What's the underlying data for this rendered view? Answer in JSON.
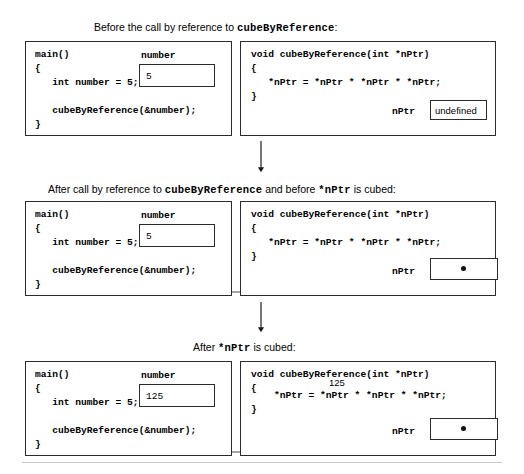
{
  "figure": {
    "title_text_hidden": "",
    "panels": [
      {
        "id": "panel-before",
        "caption_prefix": "Before the call by reference to ",
        "caption_code": "cubeByReference",
        "caption_middle": "",
        "caption_code2": "",
        "caption_suffix": ":",
        "left_box": {
          "name": "main-function-box",
          "code": "main()\n{\n   int number = 5;\n\n   cubeByReference(&number);\n}",
          "variable_label": "number",
          "variable_value": "5"
        },
        "right_box": {
          "name": "cubebyreference-function-box",
          "code": "void cubeByReference(int *nPtr)\n{\n   *nPtr = *nPtr * *nPtr * *nPtr;\n}",
          "variable_label": "nPtr",
          "variable_value": "undefined",
          "annotation": ""
        }
      },
      {
        "id": "panel-after-call",
        "caption_prefix": "After call by reference to ",
        "caption_code": "cubeByReference",
        "caption_middle": " and before ",
        "caption_code2": "*nPtr",
        "caption_suffix": " is cubed:",
        "left_box": {
          "name": "main-function-box",
          "code": "main()\n{\n   int number = 5;\n\n   cubeByReference(&number);\n}",
          "variable_label": "number",
          "variable_value": "5"
        },
        "right_box": {
          "name": "cubebyreference-function-box",
          "code": "void cubeByReference(int *nPtr)\n{\n   *nPtr = *nPtr * *nPtr * *nPtr;\n}",
          "variable_label": "nPtr",
          "variable_value": "",
          "annotation": ""
        }
      },
      {
        "id": "panel-after-cubed",
        "caption_prefix": "After ",
        "caption_code": "*nPtr",
        "caption_middle": "",
        "caption_code2": "",
        "caption_suffix": " is cubed:",
        "left_box": {
          "name": "main-function-box",
          "code": "main()\n{\n   int number = 5;\n\n   cubeByReference(&number);\n}",
          "variable_label": "number",
          "variable_value": "125"
        },
        "right_box": {
          "name": "cubebyreference-function-box",
          "code_line1": "void cubeByReference(int *nPtr)",
          "code_line2": "{",
          "code_circled": "*nPtr = *nPtr * *nPtr * *nPtr;",
          "code_line4": "}",
          "variable_label": "nPtr",
          "variable_value": "",
          "annotation": "125"
        }
      }
    ],
    "flow_arrows": 2
  }
}
